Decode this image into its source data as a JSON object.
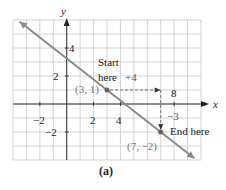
{
  "chart_data": {
    "type": "line",
    "title": "",
    "caption": "(a)",
    "xlabel": "x",
    "ylabel": "y",
    "xlim": [
      -4,
      10
    ],
    "ylim": [
      -4,
      6
    ],
    "grid": true,
    "x_ticks": [
      {
        "value": -2,
        "label": "−2"
      },
      {
        "value": 2,
        "label": "2"
      },
      {
        "value": 4,
        "label": "4"
      },
      {
        "value": 8,
        "label": "8"
      }
    ],
    "y_ticks": [
      {
        "value": 4,
        "label": "4"
      },
      {
        "value": 2,
        "label": "2"
      },
      {
        "value": -2,
        "label": "−2"
      }
    ],
    "line": {
      "slope": -0.75,
      "intercept": 3.25,
      "x_from": -3.5,
      "x_to": 9.5,
      "color": "#8a8a8a"
    },
    "points": [
      {
        "x": 3,
        "y": 1,
        "label": "(3, 1)"
      },
      {
        "x": 7,
        "y": -2,
        "label": "(7, −2)"
      }
    ],
    "annotations": {
      "start_line1": "Start",
      "start_line2": "here",
      "run_label": "+4",
      "rise_label": "−3",
      "end_label": "End here"
    },
    "run": {
      "from": [
        3,
        1
      ],
      "to": [
        7,
        1
      ]
    },
    "rise": {
      "from": [
        7,
        1
      ],
      "to": [
        7,
        -2
      ]
    }
  }
}
